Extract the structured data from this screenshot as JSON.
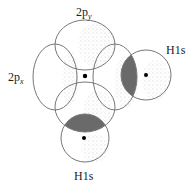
{
  "diagram": {
    "labels": {
      "p_y": {
        "base": "2p",
        "sub": "y"
      },
      "p_x": {
        "base": "2p",
        "sub": "x"
      },
      "h_right": "H1s",
      "h_bottom": "H1s"
    },
    "colors": {
      "outline": "#777777",
      "stipple": "#8a8a8a",
      "overlap": "#6a6a6a",
      "nucleus": "#000000"
    }
  }
}
